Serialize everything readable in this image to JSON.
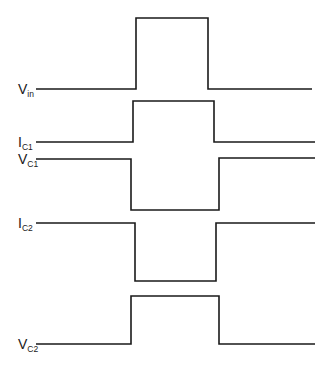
{
  "diagram": {
    "type": "timing-waveform",
    "stroke_color": "#1a1a1a",
    "background": "#ffffff",
    "signals": [
      {
        "id": "vin",
        "label_main": "V",
        "label_sub": "in",
        "label_pos": [
          18,
          94
        ],
        "points": [
          [
            36,
            89
          ],
          [
            136,
            89
          ],
          [
            136,
            18
          ],
          [
            208,
            18
          ],
          [
            208,
            89
          ],
          [
            312,
            89
          ]
        ]
      },
      {
        "id": "ic1",
        "label_main": "I",
        "label_sub": "C1",
        "label_pos": [
          18,
          147
        ],
        "points": [
          [
            36,
            142
          ],
          [
            133,
            142
          ],
          [
            133,
            101
          ],
          [
            214,
            101
          ],
          [
            214,
            142
          ],
          [
            315,
            142
          ]
        ]
      },
      {
        "id": "vc1",
        "label_main": "V",
        "label_sub": "C1",
        "label_pos": [
          18,
          164
        ],
        "points": [
          [
            36,
            159
          ],
          [
            131,
            159
          ],
          [
            131,
            210
          ],
          [
            219,
            210
          ],
          [
            219,
            158
          ],
          [
            315,
            158
          ]
        ]
      },
      {
        "id": "ic2",
        "label_main": "I",
        "label_sub": "C2",
        "label_pos": [
          18,
          228
        ],
        "points": [
          [
            36,
            223
          ],
          [
            135,
            223
          ],
          [
            135,
            281
          ],
          [
            216,
            281
          ],
          [
            216,
            223
          ],
          [
            315,
            223
          ]
        ]
      },
      {
        "id": "vc2",
        "label_main": "V",
        "label_sub": "C2",
        "label_pos": [
          18,
          349
        ],
        "points": [
          [
            36,
            344
          ],
          [
            131,
            344
          ],
          [
            131,
            296
          ],
          [
            219,
            296
          ],
          [
            219,
            344
          ],
          [
            315,
            344
          ]
        ]
      }
    ]
  }
}
